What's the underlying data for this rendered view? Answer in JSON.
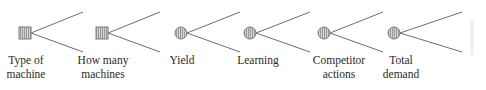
{
  "diagram": {
    "type": "decision-tree-legend",
    "line_color": "#6e6e6e",
    "node_fill": "#c8c8c8",
    "node_stroke": "#7a7a7a",
    "nodes": [
      {
        "shape": "square",
        "kind": "decision-node-icon",
        "cx": 25,
        "cy": 33,
        "label_lines": [
          "Type of",
          "machine"
        ]
      },
      {
        "shape": "square",
        "kind": "decision-node-icon",
        "cx": 102,
        "cy": 33,
        "label_lines": [
          "How many",
          "machines"
        ]
      },
      {
        "shape": "circle",
        "kind": "chance-node-icon",
        "cx": 181,
        "cy": 33,
        "label_lines": [
          "Yield"
        ]
      },
      {
        "shape": "circle",
        "kind": "chance-node-icon",
        "cx": 250,
        "cy": 33,
        "label_lines": [
          "Learning"
        ]
      },
      {
        "shape": "circle",
        "kind": "chance-node-icon",
        "cx": 324,
        "cy": 33,
        "label_lines": [
          "Competitor",
          "actions"
        ]
      },
      {
        "shape": "circle",
        "kind": "chance-node-icon",
        "cx": 394,
        "cy": 33,
        "label_lines": [
          "Total",
          "demand"
        ]
      }
    ]
  },
  "labels": {
    "n0": {
      "l1": "Type of",
      "l2": "machine"
    },
    "n1": {
      "l1": "How many",
      "l2": "machines"
    },
    "n2": {
      "l1": "Yield",
      "l2": ""
    },
    "n3": {
      "l1": "Learning",
      "l2": ""
    },
    "n4": {
      "l1": "Competitor",
      "l2": "actions"
    },
    "n5": {
      "l1": "Total",
      "l2": "demand"
    }
  }
}
